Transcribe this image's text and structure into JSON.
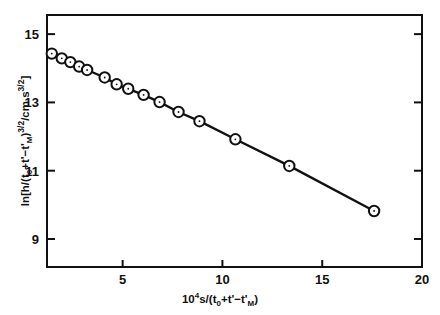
{
  "figure": {
    "background_color": "#ffffff",
    "ink_color": "#111111",
    "marker_fill": "#ffffff"
  },
  "chart_data": {
    "type": "scatter",
    "title": "",
    "subtitle": "",
    "xlabel": "10^4 s/(t_0 + t' - t'_M)",
    "ylabel": "ln[h/(t_0 + t' - t'_M)^(3/2) / cm s^(3/2)]",
    "xlabel_parts": {
      "lead": "10",
      "lead_exp": "4",
      "unit": "s",
      "slash": "/",
      "open": "(",
      "t0": "t",
      "t0_sub": "0",
      "plus": "+",
      "tprime": "t'",
      "minus": "−",
      "tM": "t'",
      "tM_sub": "M",
      "close": ")"
    },
    "ylabel_parts": {
      "ln": "ln",
      "bracket_open": "[",
      "h": "h",
      "slash1": "/",
      "open": "(",
      "t0": "t",
      "t0_sub": "0",
      "plus": "+",
      "tprime": "t'",
      "minus": "−",
      "tM": "t'",
      "tM_sub": "M",
      "close": ")",
      "exp": "3/2",
      "slash2": "/",
      "units": "cm s",
      "units_exp": "3/2",
      "bracket_close": "]"
    },
    "xlim": [
      1.21,
      20.0
    ],
    "ylim": [
      8.18,
      15.56
    ],
    "xticks": [
      5,
      10,
      15,
      20
    ],
    "xtick_labels": [
      "5",
      "10",
      "15",
      "20"
    ],
    "yticks": [
      9,
      11,
      13,
      15
    ],
    "ytick_labels": [
      "9",
      "11",
      "13",
      "15"
    ],
    "grid": false,
    "legend": null,
    "line_style": "solid",
    "marker": "open-circle-with-center-dot",
    "series": [
      {
        "name": "data",
        "x": [
          1.45,
          1.95,
          2.38,
          2.82,
          3.22,
          4.1,
          4.7,
          5.28,
          6.05,
          6.85,
          7.8,
          8.85,
          10.65,
          13.35,
          17.6
        ],
        "y": [
          14.43,
          14.29,
          14.18,
          14.05,
          13.95,
          13.73,
          13.53,
          13.4,
          13.22,
          13.01,
          12.72,
          12.45,
          11.92,
          11.14,
          9.82
        ],
        "color": "#111111"
      }
    ]
  }
}
